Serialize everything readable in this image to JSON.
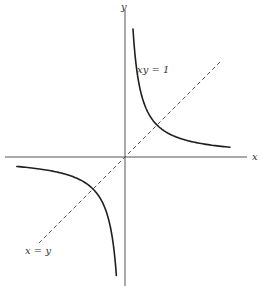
{
  "figure": {
    "type": "diagram",
    "colors": {
      "curve": "#1f1f1f",
      "axis": "#555555",
      "label": "#333333",
      "background": "#ffffff"
    },
    "axes": {
      "x_label": "x",
      "y_label": "y"
    },
    "labels": {
      "hyperbola": "xy = 1",
      "diagonal": "x = y"
    },
    "geometry": {
      "origin_px": [
        125,
        157
      ],
      "scale_px_per_unit": 32,
      "x_axis_px": [
        5,
        247
      ],
      "y_axis_px": [
        10,
        286
      ],
      "upper_branch_x_range": [
        0.25,
        3.28
      ],
      "lower_branch_x_range": [
        -3.38,
        -0.27
      ],
      "diagonal_x_range": [
        -2.69,
        3.0
      ]
    },
    "features": [
      {
        "name": "hyperbola-upper-branch",
        "quadrant": "I",
        "vertex": [
          1,
          1
        ]
      },
      {
        "name": "hyperbola-lower-branch",
        "quadrant": "III",
        "vertex": [
          -1,
          -1
        ]
      },
      {
        "name": "line-x-equals-y",
        "style": "dashed",
        "passes_through": [
          0,
          0
        ]
      }
    ]
  }
}
